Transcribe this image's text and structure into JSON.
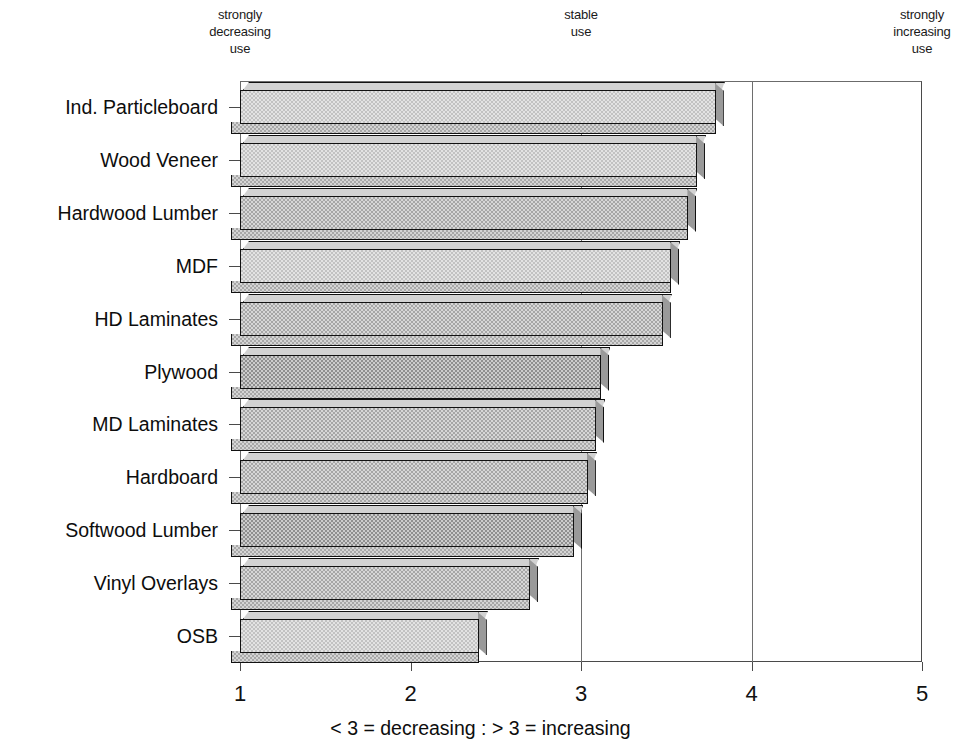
{
  "chart_data": {
    "type": "bar",
    "orientation": "horizontal",
    "title": "",
    "xlabel": "< 3 = decreasing : > 3 = increasing",
    "ylabel": "",
    "xlim": [
      1,
      5
    ],
    "xticks": [
      1,
      2,
      3,
      4,
      5
    ],
    "xtick_labels": [
      "1",
      "2",
      "3",
      "4",
      "5"
    ],
    "grid": true,
    "gridlines_at": [
      3,
      4
    ],
    "legend": "none",
    "anchor_labels": [
      {
        "text": "strongly\ndecreasing\nuse",
        "at_x": 1
      },
      {
        "text": "stable\nuse",
        "at_x": 3
      },
      {
        "text": "strongly\nincreasing\nuse",
        "at_x": 5
      }
    ],
    "categories": [
      "Ind. Particleboard",
      "Wood Veneer",
      "Hardwood Lumber",
      "MDF",
      "HD Laminates",
      "Plywood",
      "MD Laminates",
      "Hardboard",
      "Softwood Lumber",
      "Vinyl Overlays",
      "OSB"
    ],
    "values": [
      3.79,
      3.68,
      3.63,
      3.53,
      3.48,
      3.12,
      3.09,
      3.04,
      2.96,
      2.7,
      2.4
    ]
  }
}
